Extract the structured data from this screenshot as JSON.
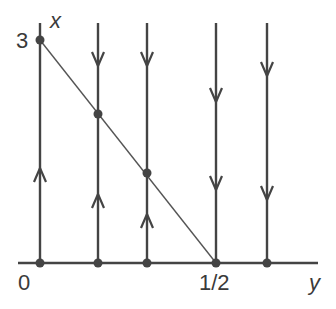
{
  "diagram": {
    "type": "phase-portrait",
    "axes": {
      "vertical_label": "x",
      "horizontal_label": "y",
      "tick_labels": {
        "x_max": "3",
        "origin": "0",
        "y_half": "1/2"
      }
    },
    "colors": {
      "stroke": "#444444",
      "text": "#3a3a3a",
      "background": "#ffffff"
    },
    "trajectories": [
      {
        "y_pos": 40,
        "arrows": [
          {
            "at": 172,
            "dir": "up"
          }
        ]
      },
      {
        "y_pos": 98,
        "arrows": [
          {
            "at": 62,
            "dir": "down"
          },
          {
            "at": 198,
            "dir": "up"
          }
        ]
      },
      {
        "y_pos": 147,
        "arrows": [
          {
            "at": 62,
            "dir": "down"
          },
          {
            "at": 218,
            "dir": "up"
          }
        ]
      },
      {
        "y_pos": 216,
        "arrows": [
          {
            "at": 98,
            "dir": "down"
          },
          {
            "at": 186,
            "dir": "down"
          }
        ]
      },
      {
        "y_pos": 267,
        "arrows": [
          {
            "at": 72,
            "dir": "down"
          },
          {
            "at": 196,
            "dir": "down"
          }
        ]
      }
    ],
    "equilibrium_line": "diagonal from (0,3) to (1/2,0)"
  }
}
